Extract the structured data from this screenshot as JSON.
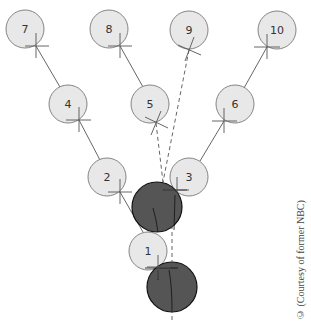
{
  "diagram": {
    "colors": {
      "light_node_fill": "#e8e8e8",
      "node_stroke": "#777777",
      "dark_node_fill": "#555555",
      "dark_node_stroke": "#111111",
      "line": "#555555"
    },
    "nodes": [
      {
        "id": "1",
        "label": "1",
        "cx": 148,
        "cy": 251
      },
      {
        "id": "2",
        "label": "2",
        "cx": 107,
        "cy": 177
      },
      {
        "id": "3",
        "label": "3",
        "cx": 189,
        "cy": 177
      },
      {
        "id": "4",
        "label": "4",
        "cx": 68,
        "cy": 104
      },
      {
        "id": "5",
        "label": "5",
        "cx": 150,
        "cy": 104
      },
      {
        "id": "6",
        "label": "6",
        "cx": 235,
        "cy": 104
      },
      {
        "id": "7",
        "label": "7",
        "cx": 25,
        "cy": 29
      },
      {
        "id": "8",
        "label": "8",
        "cx": 109,
        "cy": 29
      },
      {
        "id": "9",
        "label": "9",
        "cx": 189,
        "cy": 30
      },
      {
        "id": "10",
        "label": "10",
        "cx": 277,
        "cy": 30
      }
    ],
    "dark_nodes": [
      {
        "id": "dark-upper",
        "cx": 157,
        "cy": 207
      },
      {
        "id": "dark-lower",
        "cx": 172,
        "cy": 287
      }
    ],
    "solid_edges": [
      {
        "from": "7",
        "to": "4"
      },
      {
        "from": "8",
        "to": "5"
      },
      {
        "from": "10",
        "to": "6"
      },
      {
        "from": "4",
        "to": "2"
      },
      {
        "from": "6",
        "to": "3"
      },
      {
        "from": "2",
        "to": "dark-upper"
      }
    ],
    "dashed_edges": [
      {
        "from": "5",
        "to": "dark-upper"
      },
      {
        "from": "9",
        "to": "dark-upper"
      },
      {
        "from": "3",
        "to": "dark-lower"
      }
    ]
  },
  "credit": "© (Courtesy of former NBC)"
}
